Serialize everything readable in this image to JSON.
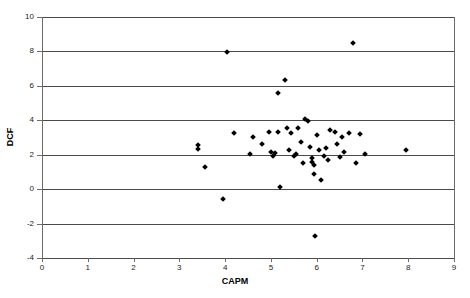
{
  "chart_data": {
    "type": "scatter",
    "title": "",
    "xlabel": "CAPM",
    "ylabel": "DCF",
    "xlim": [
      0,
      9
    ],
    "ylim": [
      -4,
      10
    ],
    "xticks": [
      0,
      1,
      2,
      3,
      4,
      5,
      6,
      7,
      8,
      9
    ],
    "yticks": [
      -4,
      -2,
      0,
      2,
      4,
      6,
      8,
      10
    ],
    "grid": "horizontal",
    "legend": "none",
    "marker": "diamond",
    "marker_color": "#000000",
    "series": [
      {
        "name": "Companies",
        "points": [
          [
            3.4,
            2.55
          ],
          [
            3.4,
            2.35
          ],
          [
            3.55,
            1.3
          ],
          [
            4.05,
            7.95
          ],
          [
            3.95,
            -0.6
          ],
          [
            4.2,
            3.25
          ],
          [
            4.55,
            2.05
          ],
          [
            4.6,
            3.05
          ],
          [
            4.8,
            2.65
          ],
          [
            4.95,
            3.3
          ],
          [
            5.0,
            2.15
          ],
          [
            5.05,
            1.95
          ],
          [
            5.1,
            2.1
          ],
          [
            5.15,
            5.6
          ],
          [
            5.15,
            3.3
          ],
          [
            5.2,
            0.15
          ],
          [
            5.3,
            6.35
          ],
          [
            5.35,
            3.55
          ],
          [
            5.4,
            2.3
          ],
          [
            5.45,
            3.25
          ],
          [
            5.5,
            1.95
          ],
          [
            5.55,
            2.05
          ],
          [
            5.6,
            3.55
          ],
          [
            5.65,
            2.75
          ],
          [
            5.7,
            1.5
          ],
          [
            5.75,
            4.1
          ],
          [
            5.8,
            3.95
          ],
          [
            5.85,
            2.45
          ],
          [
            5.9,
            1.8
          ],
          [
            5.9,
            1.55
          ],
          [
            5.95,
            1.4
          ],
          [
            5.95,
            0.9
          ],
          [
            5.96,
            -2.75
          ],
          [
            6.0,
            3.15
          ],
          [
            6.05,
            2.3
          ],
          [
            6.1,
            0.55
          ],
          [
            6.15,
            1.95
          ],
          [
            6.2,
            2.4
          ],
          [
            6.25,
            1.7
          ],
          [
            6.3,
            3.45
          ],
          [
            6.4,
            3.3
          ],
          [
            6.45,
            2.6
          ],
          [
            6.5,
            1.85
          ],
          [
            6.55,
            3.05
          ],
          [
            6.6,
            2.15
          ],
          [
            6.7,
            3.25
          ],
          [
            6.8,
            8.5
          ],
          [
            6.85,
            1.5
          ],
          [
            6.95,
            3.2
          ],
          [
            7.05,
            2.05
          ],
          [
            7.95,
            2.25
          ]
        ]
      }
    ]
  }
}
